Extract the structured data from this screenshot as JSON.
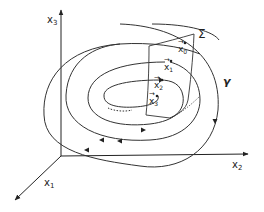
{
  "figure": {
    "type": "poincare-section-diagram",
    "axes": {
      "x1": {
        "label": "x",
        "sub": "1"
      },
      "x2": {
        "label": "x",
        "sub": "2"
      },
      "x3": {
        "label": "x",
        "sub": "3"
      }
    },
    "surface_label": "Σ",
    "trajectory_label": "γ",
    "points": [
      {
        "label": "x",
        "sub": "0",
        "arrow": "→"
      },
      {
        "label": "x",
        "sub": "1",
        "arrow": "→"
      },
      {
        "label": "x",
        "sub": "2",
        "arrow": "→"
      },
      {
        "label": "x",
        "sub": "3",
        "arrow": "→"
      }
    ],
    "line_color": "#222222",
    "background": "#ffffff"
  }
}
